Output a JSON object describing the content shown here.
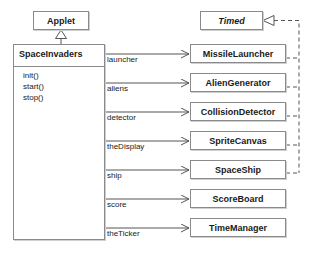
{
  "diagram": {
    "kind": "uml-class-diagram",
    "colors": {
      "stroke": "#8a8a8a",
      "line": "#555555",
      "text": "#1a1a1a",
      "background": "#ffffff",
      "shadow": "#cfcfcf"
    }
  },
  "superclass": {
    "name": "Applet",
    "relation": "generalization"
  },
  "interface": {
    "name": "Timed",
    "relation": "realization",
    "italic": true
  },
  "main_class": {
    "name": "SpaceInvaders",
    "operations": [
      "init()",
      "start()",
      "stop()"
    ]
  },
  "associations": [
    {
      "role": "launcher",
      "target": "MissileLauncher",
      "implements_timed": true
    },
    {
      "role": "aliens",
      "target": "AlienGenerator",
      "implements_timed": true
    },
    {
      "role": "detector",
      "target": "CollisionDetector",
      "implements_timed": true
    },
    {
      "role": "theDisplay",
      "target": "SpriteCanvas",
      "implements_timed": true
    },
    {
      "role": "ship",
      "target": "SpaceShip",
      "implements_timed": true
    },
    {
      "role": "score",
      "target": "ScoreBoard",
      "implements_timed": false
    },
    {
      "role": "theTicker",
      "target": "TimeManager",
      "implements_timed": false
    }
  ]
}
